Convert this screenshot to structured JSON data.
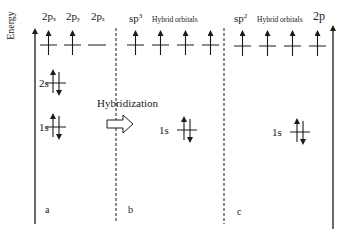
{
  "diagram": {
    "axis_label": "Energy",
    "panels": [
      {
        "id": "a",
        "letter": "a",
        "orbital_headers": [
          {
            "base": "2p",
            "sub": "x"
          },
          {
            "base": "2p",
            "sub": "y"
          },
          {
            "base": "2p",
            "sub": "z"
          }
        ],
        "levels": [
          {
            "label": "2p",
            "orbitals": [
              "up",
              "up",
              "empty"
            ]
          },
          {
            "label": "2s",
            "orbitals": [
              "paired"
            ]
          },
          {
            "label": "1s",
            "orbitals": [
              "paired"
            ]
          }
        ]
      },
      {
        "id": "b",
        "letter": "b",
        "header_main": "sp",
        "header_sup": "3",
        "header_caption": "Hybrid orbitals",
        "levels": [
          {
            "label": "sp3",
            "orbitals": [
              "up",
              "up",
              "up",
              "up"
            ]
          },
          {
            "label": "1s",
            "orbitals": [
              "paired"
            ]
          }
        ]
      },
      {
        "id": "c",
        "letter": "c",
        "header_main": "sp",
        "header_sup": "2",
        "header_caption": "Hybrid orbitals",
        "header_extra": "2p",
        "levels": [
          {
            "label": "sp2 + 2p",
            "orbitals": [
              "up",
              "up",
              "up",
              "up"
            ]
          },
          {
            "label": "1s",
            "orbitals": [
              "paired"
            ]
          }
        ]
      }
    ],
    "labels": {
      "level_2s": "2s",
      "level_1s_a": "1s",
      "level_1s_b": "1s",
      "level_1s_c": "1s",
      "process": "Hybridization"
    },
    "colors": {
      "line": "#1a1a1a",
      "background": "#ffffff"
    }
  }
}
